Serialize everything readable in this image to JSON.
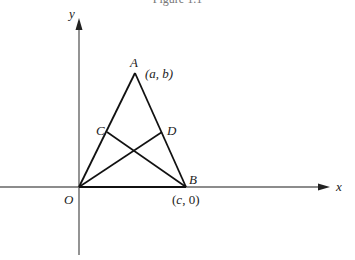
{
  "figure": {
    "caption": "Figure 1.1",
    "axes": {
      "x_label": "x",
      "y_label": "y",
      "origin_label": "O"
    },
    "points": {
      "O": {
        "label": "O"
      },
      "A": {
        "label": "A",
        "coords": "(a, b)"
      },
      "B": {
        "label": "B",
        "coords": "(c, 0)"
      },
      "C": {
        "label": "C"
      },
      "D": {
        "label": "D"
      }
    },
    "segments": [
      "OA",
      "AB",
      "OB",
      "OD",
      "BC"
    ]
  }
}
